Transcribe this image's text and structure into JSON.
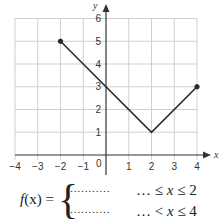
{
  "chart_data": {
    "type": "line",
    "title": "",
    "xlabel": "x",
    "ylabel": "y",
    "xlim": [
      -4,
      4
    ],
    "ylim": [
      0,
      6
    ],
    "grid": true,
    "x_ticks": [
      "-4",
      "-3",
      "-2",
      "-1",
      "0",
      "1",
      "2",
      "3",
      "4"
    ],
    "y_ticks": [
      "1",
      "2",
      "3",
      "4",
      "5",
      "6"
    ],
    "series": [
      {
        "name": "f(x)",
        "x": [
          -2,
          2,
          4
        ],
        "y": [
          5,
          1,
          3
        ],
        "endpoints": [
          {
            "x": -2,
            "y": 5,
            "style": "closed"
          },
          {
            "x": 4,
            "y": 3,
            "style": "closed"
          }
        ]
      }
    ]
  },
  "formula": {
    "lhs_func": "f",
    "lhs_arg": "(x) =",
    "rows": [
      {
        "expr": "…………",
        "cond_prefix": "… ≤ ",
        "var": "x",
        "cond_suffix": " ≤ 2"
      },
      {
        "expr": "…………",
        "cond_prefix": "… < ",
        "var": "x",
        "cond_suffix": " ≤ 4"
      }
    ]
  },
  "labels": {
    "x_axis": "x",
    "y_axis": "y",
    "origin": "0"
  }
}
